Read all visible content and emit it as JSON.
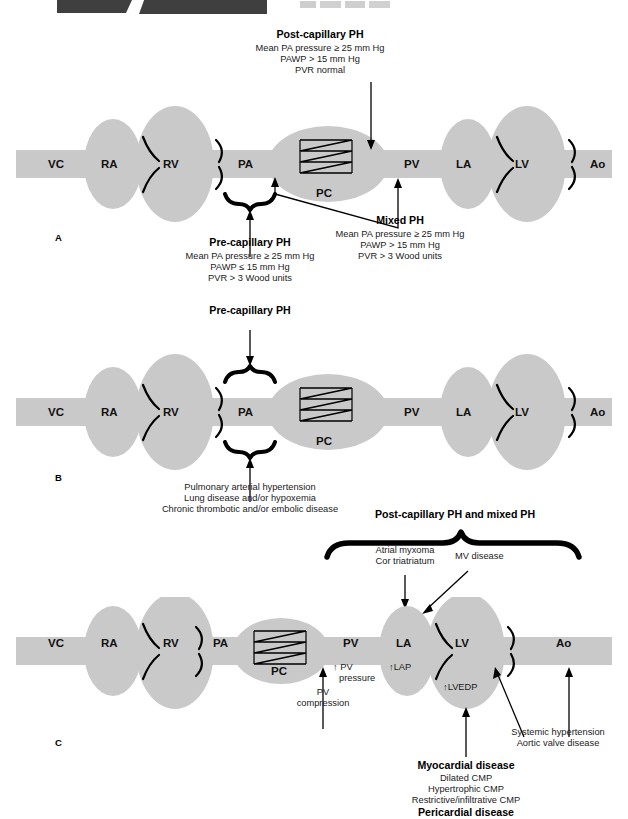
{
  "figure": {
    "type": "medical-diagram",
    "panels": [
      "A",
      "B",
      "C"
    ]
  },
  "chamber_labels": {
    "vc": "VC",
    "ra": "RA",
    "rv": "RV",
    "pa": "PA",
    "pc": "PC",
    "pv": "PV",
    "la": "LA",
    "lv": "LV",
    "ao": "Ao"
  },
  "panel_a": {
    "letter": "A",
    "post_capillary": {
      "title": "Post-capillary PH",
      "lines": [
        "Mean PA pressure ≥ 25 mm Hg",
        "PAWP > 15 mm Hg",
        "PVR normal"
      ]
    },
    "pre_capillary": {
      "title": "Pre-capillary PH",
      "lines": [
        "Mean PA pressure ≥ 25 mm Hg",
        "PAWP ≤ 15 mm Hg",
        "PVR > 3 Wood units"
      ]
    },
    "mixed": {
      "title": "Mixed PH",
      "lines": [
        "Mean PA pressure ≥ 25 mm Hg",
        "PAWP > 15 mm Hg",
        "PVR > 3 Wood units"
      ]
    }
  },
  "panel_b": {
    "letter": "B",
    "heading": "Pre-capillary PH",
    "causes": [
      "Pulmonary arterial hypertension",
      "Lung disease and/or hypoxemia",
      "Chronic thrombotic and/or embolic disease"
    ]
  },
  "panel_c": {
    "letter": "C",
    "heading": "Post-capillary PH and mixed PH",
    "atrial": [
      "Atrial myxoma",
      "Cor triatriatum"
    ],
    "mv_disease": "MV disease",
    "pv_pressure": "↑ PV\npressure",
    "pv_pressure_line1": "↑ PV",
    "pv_pressure_line2": "pressure",
    "pv_compression_line1": "PV",
    "pv_compression_line2": "compression",
    "lap": "↑LAP",
    "lvedp": "↑LVEDP",
    "systemic": [
      "Systemic hypertension",
      "Aortic valve disease"
    ],
    "myocardial": {
      "title": "Myocardial disease",
      "lines": [
        "Dilated CMP",
        "Hypertrophic CMP",
        "Restrictive/infiltrative CMP"
      ],
      "footer": "Pericardial disease"
    }
  },
  "colors": {
    "chamber_fill": "#c9c9c9",
    "vessel_fill": "#c9c9c9",
    "stroke": "#000000",
    "text": "#1a1a1a",
    "scrap_dark": "#3f3f3f"
  }
}
